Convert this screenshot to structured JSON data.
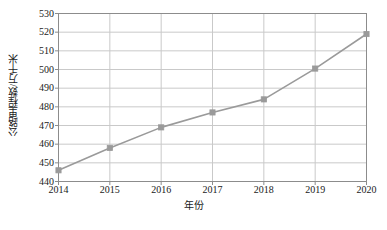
{
  "chart_data": {
    "type": "line",
    "title": "",
    "xlabel": "年份",
    "ylabel": "公路里程数/万千米",
    "categories": [
      "2014",
      "2015",
      "2016",
      "2017",
      "2018",
      "2019",
      "2020"
    ],
    "x": [
      2014,
      2015,
      2016,
      2017,
      2018,
      2019,
      2020
    ],
    "values": [
      446,
      458,
      469,
      477,
      484,
      500.5,
      519
    ],
    "series": [
      {
        "name": "公路里程数",
        "values": [
          446,
          458,
          469,
          477,
          484,
          500.5,
          519
        ]
      }
    ],
    "ylim": [
      440,
      530
    ],
    "ytick_step": 10,
    "yticks": [
      440,
      450,
      460,
      470,
      480,
      490,
      500,
      510,
      520,
      530
    ],
    "ytick_labels": [
      "440",
      "450",
      "460",
      "470",
      "480",
      "490",
      "500",
      "510",
      "520",
      "530"
    ],
    "xlim": [
      2014,
      2020
    ],
    "grid": true,
    "grid_x": true,
    "grid_y": true,
    "legend": false,
    "legend_position": "none",
    "marker": "square",
    "annotations": []
  },
  "style": {
    "line_color": "#9a9a9a",
    "marker_color": "#9a9a9a",
    "grid_color": "#c9c9c9",
    "axis_color": "#8c8c8c",
    "text_color": "#1a1a1a",
    "background": "#ffffff"
  }
}
